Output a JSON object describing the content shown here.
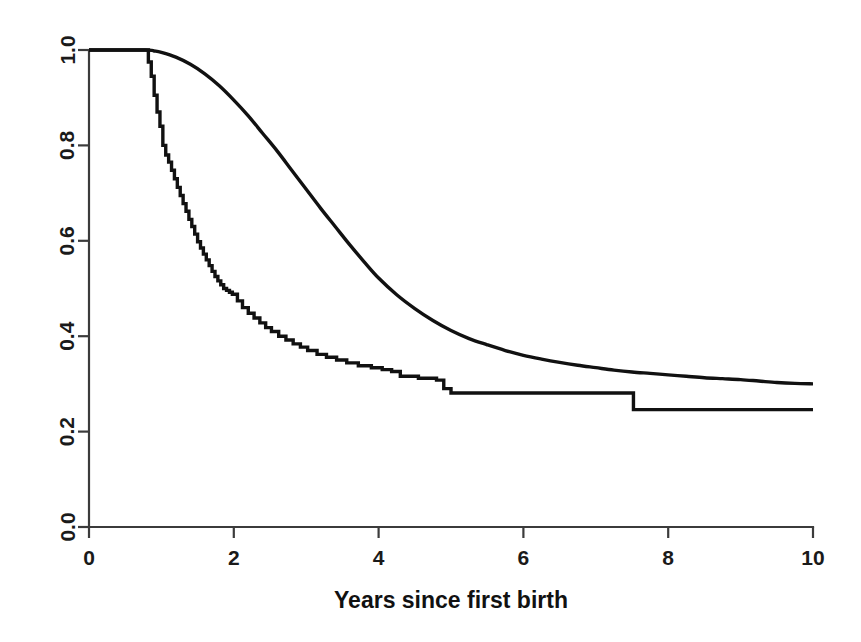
{
  "chart_data": {
    "type": "line",
    "title": "",
    "subtitle": "",
    "xlabel": "Years since first birth",
    "ylabel": "",
    "xlim": [
      0,
      10
    ],
    "ylim": [
      0.0,
      1.0
    ],
    "grid": false,
    "legend_position": "none",
    "xticks": [
      0,
      2,
      4,
      6,
      8,
      10
    ],
    "xtick_labels": [
      "0",
      "2",
      "4",
      "6",
      "8",
      "10"
    ],
    "yticks": [
      0.0,
      0.2,
      0.4,
      0.6,
      0.8,
      1.0
    ],
    "ytick_labels": [
      "0.0",
      "0.2",
      "0.4",
      "0.6",
      "0.8",
      "1.0"
    ],
    "annotations": [],
    "series": [
      {
        "name": "Step (Kaplan-Meier) curve",
        "style": "step",
        "color": "#111111",
        "x": [
          0.0,
          0.78,
          0.82,
          0.86,
          0.9,
          0.94,
          0.98,
          1.02,
          1.06,
          1.1,
          1.14,
          1.18,
          1.22,
          1.26,
          1.3,
          1.34,
          1.38,
          1.42,
          1.46,
          1.5,
          1.54,
          1.58,
          1.62,
          1.66,
          1.7,
          1.74,
          1.78,
          1.82,
          1.86,
          1.9,
          1.94,
          1.98,
          2.05,
          2.12,
          2.2,
          2.28,
          2.36,
          2.44,
          2.52,
          2.62,
          2.72,
          2.82,
          2.92,
          3.02,
          3.15,
          3.28,
          3.42,
          3.56,
          3.72,
          3.9,
          4.05,
          4.18,
          4.3,
          4.55,
          4.8,
          4.9,
          5.0,
          7.45,
          7.52,
          10.0
        ],
        "y": [
          1.0,
          1.0,
          0.975,
          0.945,
          0.905,
          0.87,
          0.84,
          0.8,
          0.78,
          0.765,
          0.748,
          0.73,
          0.712,
          0.695,
          0.678,
          0.662,
          0.645,
          0.63,
          0.614,
          0.598,
          0.585,
          0.572,
          0.56,
          0.548,
          0.536,
          0.525,
          0.516,
          0.508,
          0.5,
          0.496,
          0.492,
          0.488,
          0.474,
          0.46,
          0.448,
          0.438,
          0.428,
          0.418,
          0.41,
          0.4,
          0.392,
          0.384,
          0.377,
          0.37,
          0.362,
          0.356,
          0.35,
          0.344,
          0.338,
          0.334,
          0.33,
          0.326,
          0.316,
          0.312,
          0.308,
          0.29,
          0.281,
          0.281,
          0.246,
          0.246
        ]
      },
      {
        "name": "Smooth (fitted) curve",
        "style": "smooth",
        "color": "#111111",
        "x": [
          0.0,
          0.78,
          0.9,
          1.0,
          1.2,
          1.4,
          1.6,
          1.8,
          2.0,
          2.2,
          2.4,
          2.6,
          2.8,
          3.0,
          3.2,
          3.4,
          3.6,
          3.8,
          4.0,
          4.25,
          4.5,
          4.75,
          5.0,
          5.25,
          5.5,
          5.75,
          6.0,
          6.25,
          6.5,
          6.75,
          7.0,
          7.25,
          7.5,
          7.75,
          8.0,
          8.25,
          8.5,
          8.75,
          9.0,
          9.25,
          9.5,
          9.75,
          10.0
        ],
        "y": [
          1.0,
          1.0,
          0.998,
          0.995,
          0.985,
          0.97,
          0.95,
          0.925,
          0.895,
          0.862,
          0.825,
          0.788,
          0.748,
          0.708,
          0.668,
          0.63,
          0.592,
          0.556,
          0.522,
          0.487,
          0.458,
          0.433,
          0.412,
          0.395,
          0.382,
          0.37,
          0.36,
          0.352,
          0.345,
          0.339,
          0.334,
          0.329,
          0.325,
          0.322,
          0.319,
          0.316,
          0.313,
          0.311,
          0.309,
          0.306,
          0.303,
          0.301,
          0.3
        ]
      }
    ]
  },
  "axis": {
    "x_title": "Years since first birth"
  }
}
